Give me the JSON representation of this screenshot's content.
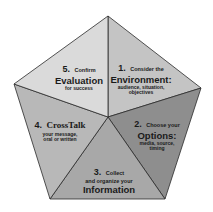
{
  "diagram": {
    "shape": "pentagon",
    "colors": {
      "segment1": "#c4c4c4",
      "segment2": "#8e8e8e",
      "segment3": "#a8a8a8",
      "segment4": "#b8b8b8",
      "segment5": "#dadada",
      "stroke": "#2a2a2a"
    },
    "segments": [
      {
        "number": "1.",
        "pre": "Consider the",
        "title": "Environment:",
        "detail": "audience, situation, objectives"
      },
      {
        "number": "2.",
        "pre": "Choose your",
        "title": "Options:",
        "detail": "media, source, timing"
      },
      {
        "number": "3.",
        "pre": "Collect",
        "pre2": "and organize your",
        "title": "Information"
      },
      {
        "number": "4.",
        "title": "CrossTalk",
        "detail": "your message, oral or written"
      },
      {
        "number": "5.",
        "pre": "Confirm",
        "title": "Evaluation",
        "detail": "for success"
      }
    ]
  }
}
